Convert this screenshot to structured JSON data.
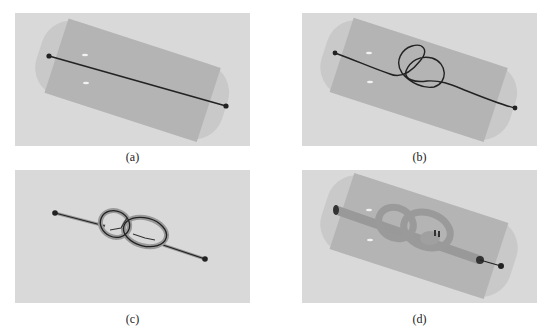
{
  "figure": {
    "panels": [
      {
        "id": "a",
        "label": "(a)",
        "content": "straight rope inside transparent cylinder"
      },
      {
        "id": "b",
        "label": "(b)",
        "content": "rope with loose figure-eight knot inside cylinder"
      },
      {
        "id": "c",
        "label": "(c)",
        "content": "tightened knot with tube rendering, no cylinder"
      },
      {
        "id": "d",
        "label": "(d)",
        "content": "thick tube knot inside cylinder"
      }
    ],
    "colors": {
      "background": "#d9d9d9",
      "cylinder_outer": "#c8c8c8",
      "cylinder_inner": "#b3b3b3",
      "rope": "#2a2a2a",
      "tube": "#999999"
    }
  }
}
